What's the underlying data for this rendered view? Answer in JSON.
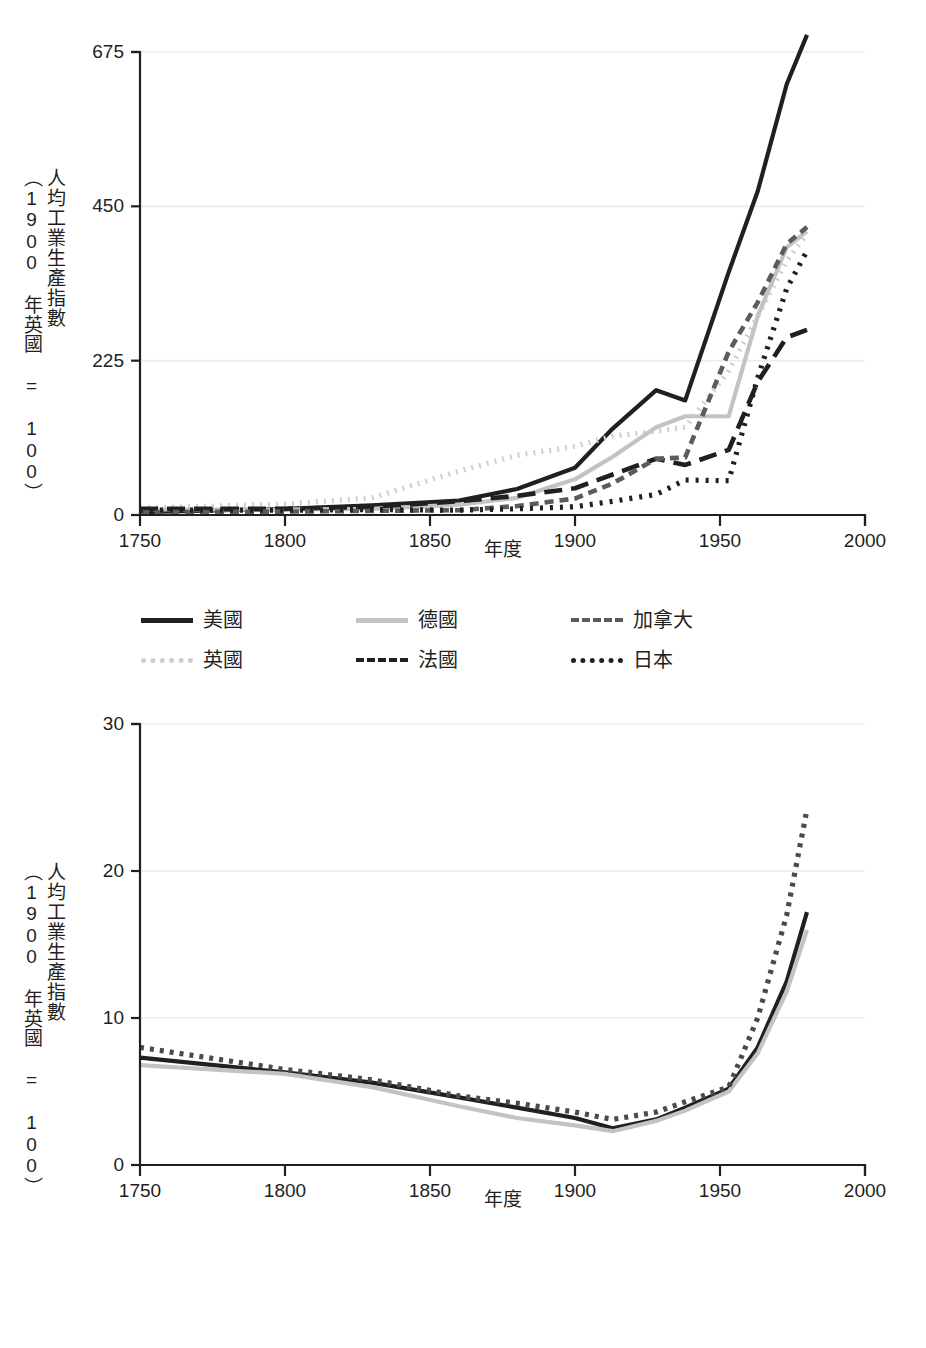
{
  "figures": [
    {
      "id": "top",
      "axis": {
        "ylabel_main": "人均工業生產指數",
        "ylabel_sub": "（1900 年英國 = 100）",
        "xlabel": "年度",
        "yticks": [
          "0",
          "225",
          "450",
          "675"
        ],
        "xticks": [
          "1750",
          "1800",
          "1850",
          "1900",
          "1950",
          "2000"
        ]
      },
      "legend": [
        {
          "label": "美國",
          "style": "solid",
          "color": "#231f20",
          "dash": "none"
        },
        {
          "label": "德國",
          "style": "solid",
          "color": "#c3c3c3",
          "dash": "none"
        },
        {
          "label": "加拿大",
          "style": "dashed",
          "color": "#5c5c5c",
          "dash": "9 6"
        },
        {
          "label": "英國",
          "style": "dotted",
          "color": "#cfcfcf",
          "dash": "2 6"
        },
        {
          "label": "法國",
          "style": "dashed",
          "color": "#231f20",
          "dash": "18 9"
        },
        {
          "label": "日本",
          "style": "dotted",
          "color": "#231f20",
          "dash": "3 7"
        }
      ]
    },
    {
      "id": "bottom",
      "axis": {
        "ylabel_main": "人均工業生產指數",
        "ylabel_sub": "（1900 年英國 = 100）",
        "xlabel": "年度",
        "yticks": [
          "0",
          "10",
          "20",
          "30"
        ],
        "xticks": [
          "1750",
          "1800",
          "1850",
          "1900",
          "1950",
          "2000"
        ]
      },
      "legend": [
        {
          "label": "開發中世界",
          "style": "solid",
          "color": "#231f20",
          "dash": "none"
        },
        {
          "label": "印度",
          "style": "solid",
          "color": "#c3c3c3",
          "dash": "none"
        },
        {
          "label": "中國",
          "style": "dotted",
          "color": "#4a4a4a",
          "dash": "4 6"
        }
      ]
    }
  ],
  "chart_data": [
    {
      "type": "line",
      "title": "",
      "xlabel": "年度",
      "ylabel": "人均工業生產指數（1900 年英國 = 100）",
      "xlim": [
        1750,
        2000
      ],
      "ylim": [
        0,
        675
      ],
      "xticks": [
        1750,
        1800,
        1850,
        1900,
        1950,
        2000
      ],
      "yticks": [
        0,
        225,
        450,
        675
      ],
      "grid": "horizontal",
      "legend_position": "below",
      "series": [
        {
          "name": "美國",
          "style": "solid",
          "color": "#231f20",
          "x": [
            1750,
            1800,
            1830,
            1860,
            1880,
            1900,
            1913,
            1928,
            1938,
            1953,
            1963,
            1973,
            1980
          ],
          "values": [
            4,
            9,
            14,
            21,
            38,
            69,
            126,
            182,
            167,
            354,
            472,
            628,
            700
          ]
        },
        {
          "name": "英國",
          "style": "dotted",
          "color": "#cfcfcf",
          "x": [
            1750,
            1800,
            1830,
            1860,
            1880,
            1900,
            1913,
            1928,
            1938,
            1953,
            1963,
            1973,
            1980
          ],
          "values": [
            10,
            16,
            25,
            64,
            87,
            100,
            115,
            122,
            128,
            210,
            290,
            370,
            410
          ]
        },
        {
          "name": "德國",
          "style": "solid",
          "color": "#c3c3c3",
          "x": [
            1750,
            1800,
            1830,
            1860,
            1880,
            1900,
            1913,
            1928,
            1938,
            1953,
            1963,
            1973,
            1980
          ],
          "values": [
            8,
            8,
            9,
            15,
            25,
            52,
            85,
            128,
            144,
            144,
            290,
            390,
            414
          ]
        },
        {
          "name": "法國",
          "style": "dashed",
          "color": "#231f20",
          "x": [
            1750,
            1800,
            1830,
            1860,
            1880,
            1900,
            1913,
            1928,
            1938,
            1953,
            1963,
            1973,
            1980
          ],
          "values": [
            9,
            9,
            12,
            20,
            28,
            39,
            59,
            82,
            73,
            95,
            194,
            259,
            270
          ]
        },
        {
          "name": "加拿大",
          "style": "dashed",
          "color": "#5c5c5c",
          "x": [
            1750,
            1800,
            1830,
            1860,
            1880,
            1900,
            1913,
            1928,
            1938,
            1953,
            1963,
            1973,
            1980
          ],
          "values": [
            4,
            5,
            6,
            7,
            13,
            24,
            46,
            82,
            84,
            238,
            310,
            395,
            420
          ]
        },
        {
          "name": "日本",
          "style": "dotted",
          "color": "#231f20",
          "x": [
            1750,
            1800,
            1830,
            1860,
            1880,
            1900,
            1913,
            1928,
            1938,
            1953,
            1963,
            1973,
            1980
          ],
          "values": [
            7,
            7,
            8,
            7,
            9,
            12,
            20,
            30,
            51,
            50,
            200,
            330,
            385
          ]
        }
      ]
    },
    {
      "type": "line",
      "title": "",
      "xlabel": "年度",
      "ylabel": "人均工業生產指數（1900 年英國 = 100）",
      "xlim": [
        1750,
        2000
      ],
      "ylim": [
        0,
        30
      ],
      "xticks": [
        1750,
        1800,
        1850,
        1900,
        1950,
        2000
      ],
      "yticks": [
        0,
        10,
        20,
        30
      ],
      "grid": "horizontal",
      "legend_position": "below",
      "series": [
        {
          "name": "開發中世界",
          "style": "solid",
          "color": "#231f20",
          "x": [
            1750,
            1800,
            1830,
            1860,
            1880,
            1900,
            1913,
            1928,
            1938,
            1953,
            1963,
            1973,
            1980
          ],
          "values": [
            7.3,
            6.3,
            5.6,
            4.6,
            3.9,
            3.2,
            2.5,
            3.1,
            3.9,
            5.2,
            8.0,
            12.5,
            17.2
          ]
        },
        {
          "name": "印度",
          "style": "solid",
          "color": "#c3c3c3",
          "x": [
            1750,
            1800,
            1830,
            1860,
            1880,
            1900,
            1913,
            1928,
            1938,
            1953,
            1963,
            1973,
            1980
          ],
          "values": [
            6.8,
            6.2,
            5.3,
            4.0,
            3.2,
            2.7,
            2.3,
            3.0,
            3.7,
            5.0,
            7.6,
            11.8,
            16.0
          ]
        },
        {
          "name": "中國",
          "style": "dotted",
          "color": "#4a4a4a",
          "x": [
            1750,
            1800,
            1830,
            1860,
            1880,
            1900,
            1913,
            1928,
            1938,
            1953,
            1963,
            1973,
            1980
          ],
          "values": [
            8.0,
            6.5,
            5.8,
            4.7,
            4.2,
            3.6,
            3.1,
            3.6,
            4.3,
            5.3,
            10.0,
            17.0,
            24.2
          ]
        }
      ]
    }
  ]
}
